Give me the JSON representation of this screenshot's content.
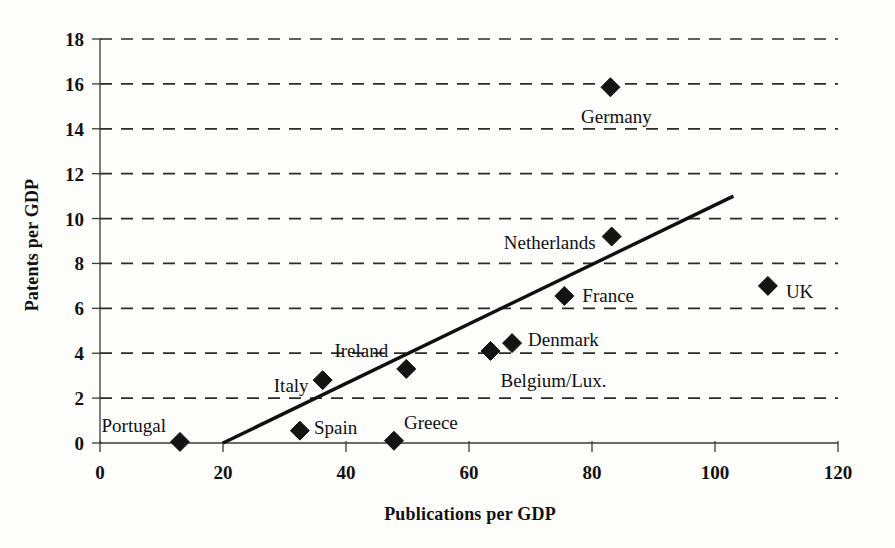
{
  "chart_data": {
    "type": "scatter",
    "title": "",
    "xlabel": "Publications per GDP",
    "ylabel": "Patents per GDP",
    "xlim": [
      0,
      120
    ],
    "ylim": [
      0,
      18
    ],
    "xticks": [
      0,
      20,
      40,
      60,
      80,
      100,
      120
    ],
    "yticks": [
      0,
      2,
      4,
      6,
      8,
      10,
      12,
      14,
      16,
      18
    ],
    "grid": "horizontal-dashed",
    "legend": "none",
    "points": [
      {
        "label": "Portugal",
        "x": 13.0,
        "y": 0.05,
        "label_dx": -14,
        "label_dy": -16,
        "label_anchor": "end"
      },
      {
        "label": "Spain",
        "x": 32.5,
        "y": 0.55,
        "label_dx": 14,
        "label_dy": -3,
        "label_anchor": "start"
      },
      {
        "label": "Greece",
        "x": 47.8,
        "y": 0.1,
        "label_dx": 10,
        "label_dy": -18,
        "label_anchor": "start"
      },
      {
        "label": "Italy",
        "x": 36.2,
        "y": 2.8,
        "label_dx": -14,
        "label_dy": 6,
        "label_anchor": "end"
      },
      {
        "label": "Ireland",
        "x": 49.8,
        "y": 3.3,
        "label_dx": -18,
        "label_dy": -18,
        "label_anchor": "end"
      },
      {
        "label": "Belgium/Lux.",
        "x": 63.5,
        "y": 4.1,
        "label_dx": 10,
        "label_dy": 30,
        "label_anchor": "start"
      },
      {
        "label": "Denmark",
        "x": 67.0,
        "y": 4.45,
        "label_dx": 16,
        "label_dy": -3,
        "label_anchor": "start"
      },
      {
        "label": "France",
        "x": 75.5,
        "y": 6.55,
        "label_dx": 18,
        "label_dy": 0,
        "label_anchor": "start"
      },
      {
        "label": "Netherlands",
        "x": 83.2,
        "y": 9.2,
        "label_dx": -16,
        "label_dy": 6,
        "label_anchor": "end"
      },
      {
        "label": "Germany",
        "x": 83.0,
        "y": 15.85,
        "label_dx": 6,
        "label_dy": 30,
        "label_anchor": "middle"
      },
      {
        "label": "UK",
        "x": 108.6,
        "y": 7.0,
        "label_dx": 18,
        "label_dy": 6,
        "label_anchor": "start"
      }
    ],
    "trendline": {
      "x_start": 20.0,
      "y_start": 0.0,
      "x_end": 103.0,
      "y_end": 11.0
    },
    "colors": {
      "marker": "#141414",
      "trendline": "#101010",
      "gridline": "#2b2b2b",
      "axis": "#3a3a3a",
      "background": "#fdfdfb",
      "text": "#111111"
    }
  }
}
